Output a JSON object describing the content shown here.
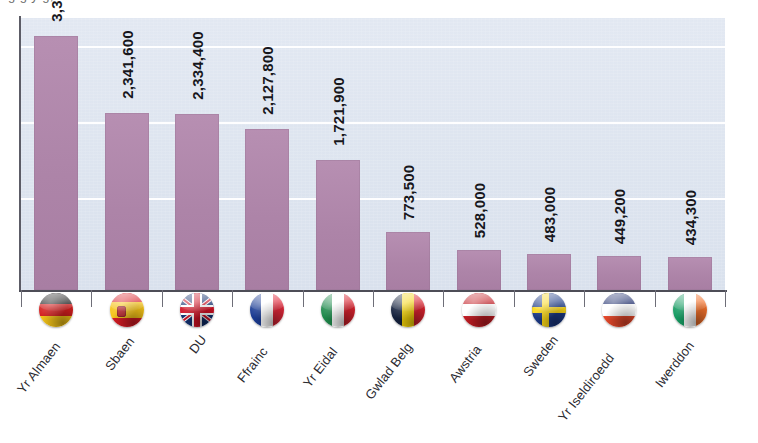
{
  "top_cutoff_text": "g    g y                         g,",
  "chart_data": {
    "type": "bar",
    "title": "",
    "subtitle": "",
    "xlabel": "",
    "ylabel": "",
    "ylim": [
      0,
      3600000
    ],
    "grid": true,
    "gridlines": [
      1000000,
      2000000,
      3000000
    ],
    "legend": "none",
    "categories": [
      "Yr Almaen",
      "Sbaen",
      "DU",
      "Ffrainc",
      "Yr Eidal",
      "Gwlad Belg",
      "Awstria",
      "Sweden",
      "Yr Iseldiroedd",
      "Iwerddon"
    ],
    "values": [
      3362600,
      2341600,
      2334400,
      2127800,
      1721900,
      773500,
      528000,
      483000,
      449200,
      434300
    ],
    "value_labels": [
      "3,362,600",
      "2,341,600",
      "2,334,400",
      "2,127,800",
      "1,721,900",
      "773,500",
      "528,000",
      "483,000",
      "449,200",
      "434,300"
    ],
    "flags": [
      "germany-flag-icon",
      "spain-flag-icon",
      "united-kingdom-flag-icon",
      "france-flag-icon",
      "italy-flag-icon",
      "belgium-flag-icon",
      "austria-flag-icon",
      "sweden-flag-icon",
      "netherlands-flag-icon",
      "ireland-flag-icon"
    ]
  },
  "colors": {
    "bar": "#b289ad",
    "plot_background": "#dde4ef",
    "gridline": "#ffffff",
    "axis": "#5c5c66",
    "label_text": "#17171c",
    "category_text": "#2b2b31"
  }
}
